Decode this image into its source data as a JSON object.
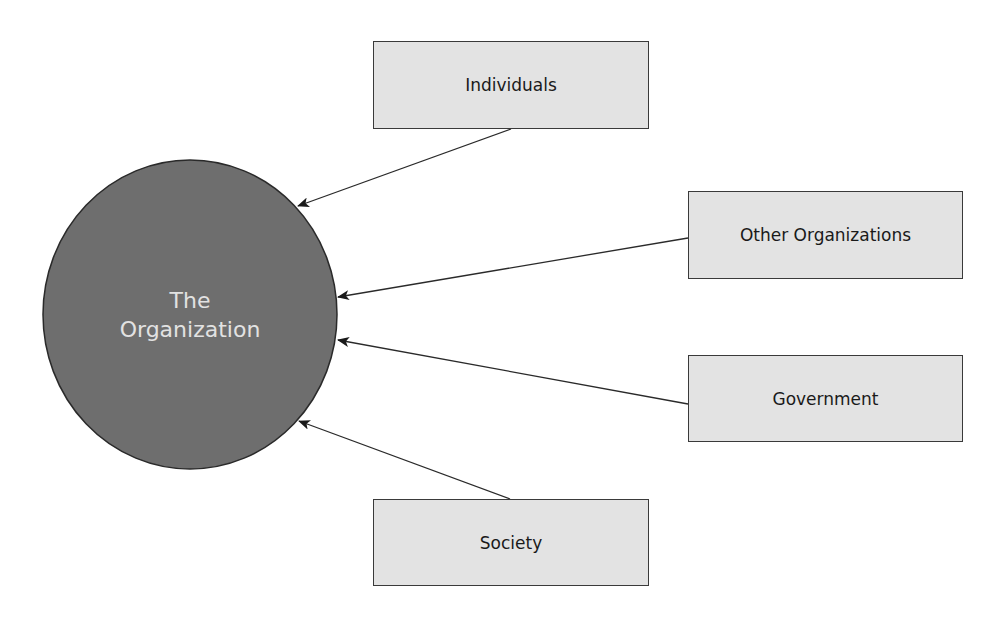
{
  "diagram": {
    "center": {
      "line1": "The",
      "line2": "Organization",
      "fill": "#6e6e6e",
      "text_color": "#e2e2e2"
    },
    "nodes": [
      {
        "label": "Individuals"
      },
      {
        "label": "Other Organizations"
      },
      {
        "label": "Government"
      },
      {
        "label": "Society"
      }
    ],
    "box_fill": "#e3e3e3",
    "edges": [
      {
        "from": "Individuals",
        "to": "The Organization"
      },
      {
        "from": "Other Organizations",
        "to": "The Organization"
      },
      {
        "from": "Government",
        "to": "The Organization"
      },
      {
        "from": "Society",
        "to": "The Organization"
      }
    ]
  }
}
